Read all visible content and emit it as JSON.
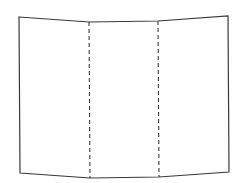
{
  "diagram": {
    "panels": 3,
    "stroke_color": "#3a3a3a",
    "fold_line_color": "#3a3a3a",
    "background": "#ffffff",
    "outline_points": [
      [
        19,
        17
      ],
      [
        89,
        22
      ],
      [
        158,
        21
      ],
      [
        228,
        16
      ],
      [
        229,
        172
      ],
      [
        159,
        177
      ],
      [
        90,
        178
      ],
      [
        20,
        173
      ]
    ],
    "fold_lines": [
      {
        "name": "left-fold",
        "x1": 89,
        "y1": 22,
        "x2": 90,
        "y2": 178,
        "style": "dashed"
      },
      {
        "name": "right-fold",
        "x1": 158,
        "y1": 21,
        "x2": 159,
        "y2": 177,
        "style": "dashed"
      }
    ]
  }
}
